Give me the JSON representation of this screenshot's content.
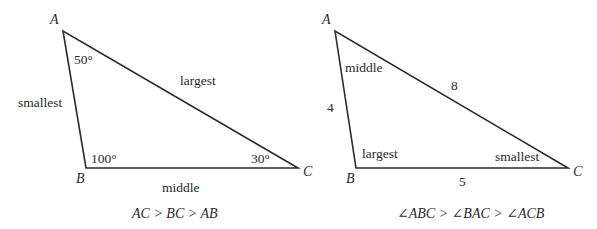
{
  "figures": [
    {
      "id": "left-triangle",
      "vertices": {
        "A": "A",
        "B": "B",
        "C": "C"
      },
      "angles": {
        "A": "50°",
        "B": "100°",
        "C": "30°"
      },
      "sides": {
        "AB": "smallest",
        "AC": "largest",
        "BC": "middle"
      },
      "relation": "AC > BC > AB"
    },
    {
      "id": "right-triangle",
      "vertices": {
        "A": "A",
        "B": "B",
        "C": "C"
      },
      "angles": {
        "A": "middle",
        "B": "largest",
        "C": "smallest"
      },
      "sides": {
        "AB": "4",
        "AC": "8",
        "BC": "5"
      },
      "relation": "∠ABC > ∠BAC > ∠ACB"
    }
  ],
  "colors": {
    "stroke": "#2a2a2a",
    "background": "#ffffff"
  }
}
